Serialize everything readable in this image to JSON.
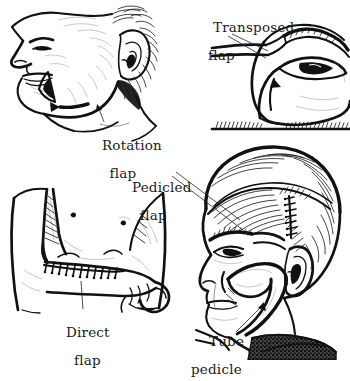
{
  "figure": {
    "background_color": "#ffffff",
    "ink_color": "#111111",
    "width": 350,
    "height": 360
  },
  "labels": {
    "rotation": {
      "line1": "Rotation",
      "line2": "flap"
    },
    "transposed": {
      "line1": "Transposed",
      "line2": "flap"
    },
    "pedicled": {
      "line1": "Pedicled",
      "line2": "flap"
    },
    "direct": {
      "line1": "Direct",
      "line2": "flap"
    },
    "tube": {
      "line1": "Tube",
      "line2": "pedicle"
    }
  },
  "panels": [
    {
      "id": "rotation-flap",
      "position": "top-left",
      "subject": "head and neck in left profile",
      "features": [
        "nose",
        "lips",
        "chin",
        "ear",
        "hair",
        "jawline",
        "triangular cheek excision",
        "rotation arrow"
      ],
      "label": "Rotation flap"
    },
    {
      "id": "transposed-flap",
      "position": "top-right",
      "subject": "eye and brow region of face",
      "features": [
        "eye",
        "eyebrow",
        "nose bridge",
        "rectangular donor flap",
        "transposition arrow",
        "hatched baseline"
      ],
      "label": "Transposed flap"
    },
    {
      "id": "direct-flap",
      "position": "bottom-left",
      "subject": "forearm attached to torso",
      "features": [
        "torso",
        "upper arm",
        "forearm",
        "fist",
        "sutured flap junction",
        "nipple"
      ],
      "label": "Direct flap"
    },
    {
      "id": "pedicled-tube-flap",
      "position": "bottom-right",
      "subject": "man's head in three-quarter view",
      "features": [
        "hair",
        "eyebrow",
        "eye",
        "nose",
        "lips",
        "ear",
        "scalp suture line",
        "tube pedicle from cheek to neck",
        "dark collar"
      ],
      "labels": [
        "Pedicled flap",
        "Tube pedicle"
      ]
    }
  ]
}
